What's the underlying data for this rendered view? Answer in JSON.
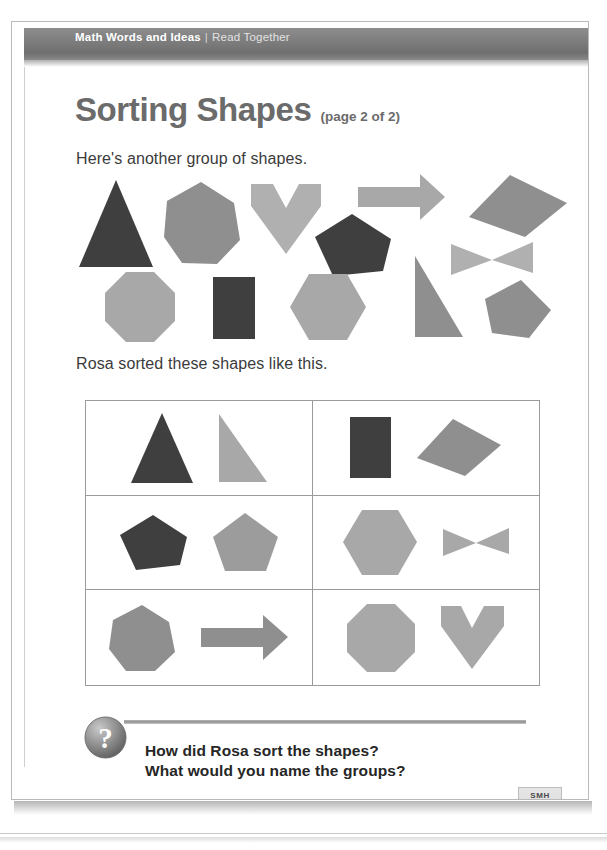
{
  "header": {
    "lead": "Math Words and Ideas",
    "separator": "|",
    "sub": "Read Together"
  },
  "title": {
    "main": "Sorting Shapes",
    "page_note": "(page 2 of 2)"
  },
  "intro_text": "Here's another group of shapes.",
  "sorted_text": "Rosa sorted these shapes like this.",
  "colors": {
    "dark_shape": "#3f3f3f",
    "mid_shape": "#8f8f8f",
    "light_shape": "#b0b0b0",
    "header_bar": "#7c7c7c",
    "title_gray": "#6b6b6b",
    "table_border": "#9a9a9a"
  },
  "shape_pool": [
    {
      "name": "triangle",
      "tone": "dark"
    },
    {
      "name": "heptagon",
      "tone": "mid"
    },
    {
      "name": "chevron",
      "tone": "light"
    },
    {
      "name": "arrow",
      "tone": "light"
    },
    {
      "name": "quadrilateral",
      "tone": "mid"
    },
    {
      "name": "pentagon-tilted",
      "tone": "dark"
    },
    {
      "name": "bowtie",
      "tone": "light"
    },
    {
      "name": "octagon",
      "tone": "light"
    },
    {
      "name": "rectangle",
      "tone": "dark"
    },
    {
      "name": "hexagon",
      "tone": "light"
    },
    {
      "name": "right-triangle",
      "tone": "mid"
    },
    {
      "name": "pentagon",
      "tone": "mid"
    }
  ],
  "sort_table": {
    "rows": 3,
    "columns": 2,
    "cells": [
      {
        "id": "cell-1",
        "shapes": [
          "triangle",
          "right-triangle"
        ]
      },
      {
        "id": "cell-2",
        "shapes": [
          "rectangle",
          "quadrilateral"
        ]
      },
      {
        "id": "cell-3",
        "shapes": [
          "pentagon-tilted",
          "pentagon"
        ]
      },
      {
        "id": "cell-4",
        "shapes": [
          "hexagon",
          "bowtie"
        ]
      },
      {
        "id": "cell-5",
        "shapes": [
          "heptagon",
          "arrow"
        ]
      },
      {
        "id": "cell-6",
        "shapes": [
          "octagon",
          "chevron"
        ]
      }
    ]
  },
  "question": {
    "icon": "question-mark-icon",
    "line1": "How did Rosa sort the shapes?",
    "line2": "What would you name the groups?"
  },
  "footer": {
    "page_word": "seventy-seven",
    "badge_label": "SMH",
    "badge_number": "77"
  }
}
